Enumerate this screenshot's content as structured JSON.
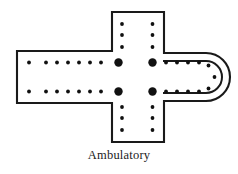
{
  "figure": {
    "kind": "architectural-floor-plan",
    "caption": "Ambulatory",
    "colors": {
      "outline": "#1a1a1a",
      "fill": "#ffffff",
      "ambulatory_shading": "#d2d2d2",
      "pier": "#111111",
      "background": "#ffffff",
      "caption_text": "#1b1b1b"
    },
    "geometry": {
      "nave_left_x": 17,
      "nave_top_y": 51,
      "nave_bottom_y": 103,
      "transept_left_x": 112,
      "transept_right_x": 164,
      "transept_top_y": 12,
      "transept_bottom_y": 142,
      "apse_outer_right_x": 232,
      "apse_center_y": 77,
      "wall_stroke_width": 2.1
    },
    "elements": {
      "nave_label": "nave",
      "transept_label": "transept",
      "crossing_label": "crossing",
      "choir_label": "choir",
      "apse_label": "apse",
      "ambulatory_band_label": "ambulatory"
    },
    "piers": {
      "crossing_large": [
        {
          "cx": 118.5,
          "cy": 62.5,
          "r": 4.2
        },
        {
          "cx": 152.5,
          "cy": 62.5,
          "r": 4.2
        },
        {
          "cx": 118.5,
          "cy": 91.5,
          "r": 4.2
        },
        {
          "cx": 152.5,
          "cy": 91.5,
          "r": 4.2
        }
      ],
      "nave_top_row": [
        {
          "cx": 29,
          "cy": 62.5,
          "r": 1.9
        },
        {
          "cx": 46,
          "cy": 62.5,
          "r": 1.9
        },
        {
          "cx": 57,
          "cy": 62.5,
          "r": 1.9
        },
        {
          "cx": 68,
          "cy": 62.5,
          "r": 1.9
        },
        {
          "cx": 79,
          "cy": 62.5,
          "r": 1.9
        },
        {
          "cx": 90,
          "cy": 62.5,
          "r": 1.9
        },
        {
          "cx": 101,
          "cy": 62.5,
          "r": 1.9
        }
      ],
      "nave_bottom_row": [
        {
          "cx": 29,
          "cy": 91.5,
          "r": 1.9
        },
        {
          "cx": 46,
          "cy": 91.5,
          "r": 1.9
        },
        {
          "cx": 57,
          "cy": 91.5,
          "r": 1.9
        },
        {
          "cx": 68,
          "cy": 91.5,
          "r": 1.9
        },
        {
          "cx": 79,
          "cy": 91.5,
          "r": 1.9
        },
        {
          "cx": 90,
          "cy": 91.5,
          "r": 1.9
        },
        {
          "cx": 101,
          "cy": 91.5,
          "r": 1.9
        }
      ],
      "transept_north_left": [
        {
          "cx": 122,
          "cy": 24,
          "r": 1.9
        },
        {
          "cx": 122,
          "cy": 35,
          "r": 1.9
        },
        {
          "cx": 122,
          "cy": 47,
          "r": 1.9
        }
      ],
      "transept_north_right": [
        {
          "cx": 152.5,
          "cy": 24,
          "r": 1.9
        },
        {
          "cx": 152.5,
          "cy": 35,
          "r": 1.9
        },
        {
          "cx": 152.5,
          "cy": 47,
          "r": 1.9
        }
      ],
      "transept_south_left": [
        {
          "cx": 122,
          "cy": 107,
          "r": 1.9
        },
        {
          "cx": 122,
          "cy": 118,
          "r": 1.9
        },
        {
          "cx": 122,
          "cy": 130,
          "r": 1.9
        }
      ],
      "transept_south_right": [
        {
          "cx": 152.5,
          "cy": 107,
          "r": 1.9
        },
        {
          "cx": 152.5,
          "cy": 118,
          "r": 1.9
        },
        {
          "cx": 152.5,
          "cy": 130,
          "r": 1.9
        }
      ],
      "choir_top_row": [
        {
          "cx": 166,
          "cy": 62.5,
          "r": 1.9
        },
        {
          "cx": 177,
          "cy": 62.5,
          "r": 1.9
        },
        {
          "cx": 188,
          "cy": 62.5,
          "r": 1.9
        },
        {
          "cx": 199,
          "cy": 62.5,
          "r": 1.9
        }
      ],
      "choir_bottom_row": [
        {
          "cx": 166,
          "cy": 91.5,
          "r": 1.9
        },
        {
          "cx": 177,
          "cy": 91.5,
          "r": 1.9
        },
        {
          "cx": 188,
          "cy": 91.5,
          "r": 1.9
        },
        {
          "cx": 199,
          "cy": 91.5,
          "r": 1.9
        }
      ],
      "apse_curve": [
        {
          "cx": 208.5,
          "cy": 65.5,
          "r": 1.9
        },
        {
          "cx": 214.5,
          "cy": 77,
          "r": 1.9
        },
        {
          "cx": 208.5,
          "cy": 88.5,
          "r": 1.9
        }
      ]
    }
  }
}
